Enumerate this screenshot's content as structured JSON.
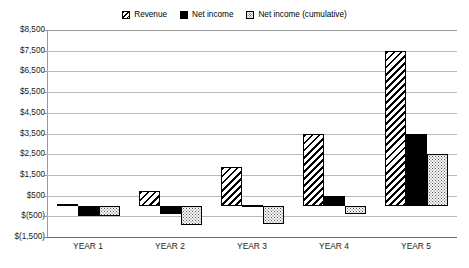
{
  "chart_data": {
    "type": "bar",
    "title": "",
    "subtitle": "",
    "xlabel": "",
    "ylabel": "",
    "categories": [
      "YEAR 1",
      "YEAR 2",
      "YEAR 3",
      "YEAR 4",
      "YEAR 5"
    ],
    "series": [
      {
        "name": "Revenue",
        "pattern": "diagonal-hatch",
        "values": [
          100,
          700,
          1900,
          3500,
          7500
        ]
      },
      {
        "name": "Net income",
        "pattern": "solid-black",
        "values": [
          -500,
          -400,
          50,
          500,
          3500
        ]
      },
      {
        "name": "Net income (cumulative)",
        "pattern": "dotted",
        "values": [
          -500,
          -900,
          -850,
          -400,
          2500
        ]
      }
    ],
    "ylim": [
      -1500,
      8500
    ],
    "ytick_step": 1000,
    "ytick_labels": [
      "$8,500",
      "$7,500",
      "$6,500",
      "$5,500",
      "$4,500",
      "$3,500",
      "$2,500",
      "$1,500",
      "$500",
      "$(500)",
      "$(1,500)"
    ],
    "ytick_values": [
      8500,
      7500,
      6500,
      5500,
      4500,
      3500,
      2500,
      1500,
      500,
      -500,
      -1500
    ],
    "grid": true,
    "grid_axis": "y",
    "legend_position": "top-center",
    "baseline_value": 0
  },
  "legend": {
    "entries": [
      {
        "label": "Revenue",
        "swatch": "hatch-swatch"
      },
      {
        "label": "Net income",
        "swatch": "solid-swatch"
      },
      {
        "label": "Net income (cumulative)",
        "swatch": "dotted-swatch"
      }
    ]
  },
  "colors": {
    "background": "#ffffff",
    "gridline": "#b9b9b9",
    "axis": "#6a6a6a",
    "text": "#1a1a1a",
    "series_net_income": "#000000"
  }
}
